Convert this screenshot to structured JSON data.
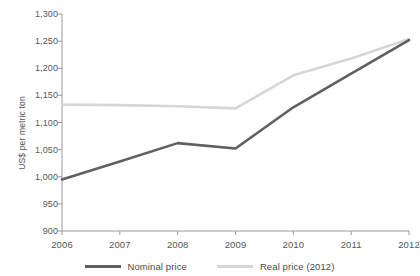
{
  "chart_data": {
    "type": "line",
    "title": "",
    "xlabel": "",
    "ylabel": "US$ per metric ton",
    "x": [
      2006,
      2007,
      2008,
      2009,
      2010,
      2011,
      2012
    ],
    "categories": [
      "2006",
      "2007",
      "2008",
      "2009",
      "2010",
      "2011",
      "2012"
    ],
    "xlim": [
      2006,
      2012
    ],
    "ylim": [
      900,
      1300
    ],
    "ytick_values": [
      900,
      950,
      1000,
      1050,
      1100,
      1150,
      1200,
      1250,
      1300
    ],
    "ytick_labels": [
      "900",
      "950",
      "1,000",
      "1,050",
      "1,100",
      "1,150",
      "1,200",
      "1,250",
      "1,300"
    ],
    "grid": false,
    "legend_position": "bottom-center",
    "series": [
      {
        "name": "Nominal price",
        "color": "#5f6063",
        "values": [
          995,
          1028,
          1062,
          1052,
          1128,
          1190,
          1252
        ]
      },
      {
        "name": "Real price (2012)",
        "color": "#d6d6d6",
        "values": [
          1133,
          1132,
          1130,
          1126,
          1187,
          1218,
          1254
        ]
      }
    ]
  },
  "axes": {
    "y_title": "US$ per metric ton",
    "y_labels": [
      "1,300",
      "1,250",
      "1,200",
      "1,150",
      "1,100",
      "1,050",
      "1,000",
      "950",
      "900"
    ],
    "x_labels": [
      "2006",
      "2007",
      "2008",
      "2009",
      "2010",
      "2011",
      "2012"
    ]
  },
  "legend": {
    "items": [
      {
        "label": "Nominal price",
        "color": "#5f6063"
      },
      {
        "label": "Real price (2012)",
        "color": "#d6d6d6"
      }
    ]
  },
  "colors": {
    "background": "#ffffff",
    "axis": "#9a9a9a",
    "text": "#56565a",
    "nominal": "#5f6063",
    "real": "#d6d6d6"
  }
}
